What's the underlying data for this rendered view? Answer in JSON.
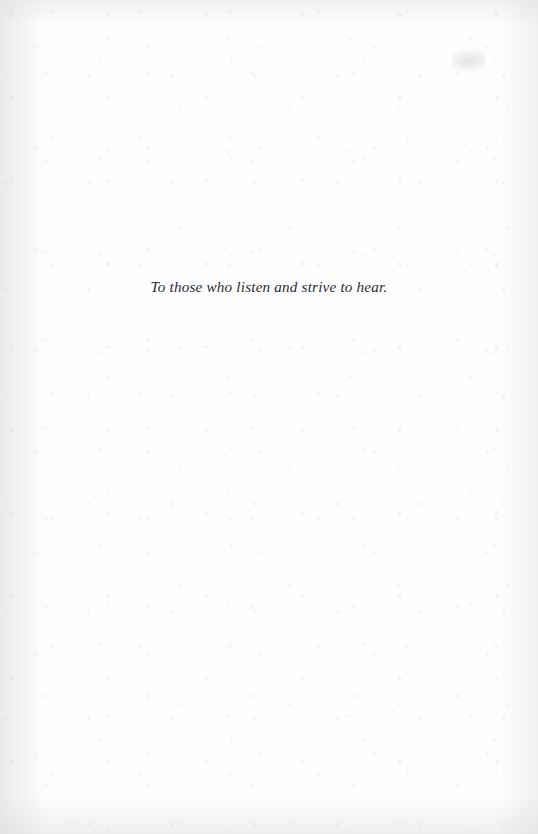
{
  "document": {
    "kind": "book-dedication-page",
    "page_background_color": "#fefefe",
    "text_color": "#2b2b30"
  },
  "dedication": {
    "text": "To those who listen and strive to hear."
  },
  "artifacts": {
    "corner_smudge_label": "",
    "paper_grain_label": ""
  }
}
